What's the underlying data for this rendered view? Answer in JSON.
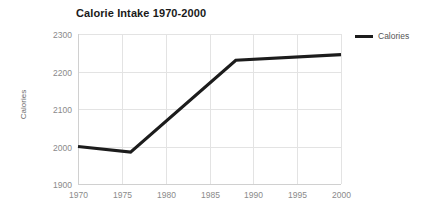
{
  "chart_data": {
    "type": "line",
    "title": "Calorie Intake 1970-2000",
    "xlabel": "",
    "ylabel": "Calories",
    "xlim": [
      1970,
      2000
    ],
    "ylim": [
      1900,
      2300
    ],
    "xticks": [
      1970,
      1975,
      1980,
      1985,
      1990,
      1995,
      2000
    ],
    "yticks": [
      1900,
      2000,
      2100,
      2200,
      2300
    ],
    "grid": true,
    "legend_position": "top-right",
    "series": [
      {
        "name": "Calories",
        "color": "#1c1c1c",
        "x": [
          1970,
          1976,
          1988,
          2000
        ],
        "values": [
          2000,
          1985,
          2230,
          2245
        ]
      }
    ]
  },
  "legend": {
    "entries": [
      {
        "label": "Calories",
        "color": "#1c1c1c"
      }
    ]
  },
  "axes": {
    "y_title": "Calories",
    "y_tick_labels": [
      "2300",
      "2200",
      "2100",
      "2000",
      "1900"
    ],
    "x_tick_labels": [
      "1970",
      "1975",
      "1980",
      "1985",
      "1990",
      "1995",
      "2000"
    ]
  },
  "colors": {
    "background": "#ffffff",
    "gridline": "#e3e3e3",
    "axis": "#d0d0d0",
    "tick_text": "#8a8a8a",
    "title_text": "#1a1a1a",
    "series": "#1c1c1c"
  }
}
